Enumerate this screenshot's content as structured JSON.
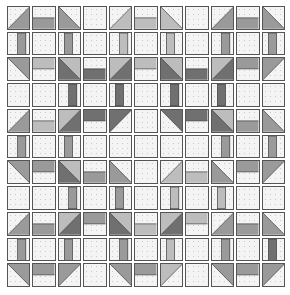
{
  "grid": {
    "rows": 11,
    "cols": 11
  },
  "fabrics": {
    "light": "#bdbdbd",
    "medium": "#9a9a9a",
    "dark": "#707070",
    "background": "#f4f4f4",
    "outline": "#555555"
  },
  "legend": {
    "E": "empty background square",
    "BR": "half-square triangle shaded bottom-right",
    "BL": "half-square triangle shaded bottom-left",
    "TR": "half-square triangle shaded top-right",
    "TL": "half-square triangle shaded top-left",
    "HB": "bar along bottom half",
    "HT": "bar along top half",
    "VL": "vertical bar left-center",
    "VR": "vertical bar right-center",
    "D1": "two-fabric HST light top-left / dark bottom-right",
    "D2": "two-fabric HST light top-right / dark bottom-left"
  },
  "cells": [
    [
      "BR:medium",
      "HB:medium",
      "BL:medium",
      "E",
      "BR:light",
      "HB:light",
      "BL:light",
      "E",
      "BR:medium",
      "HB:medium",
      "BL:medium"
    ],
    [
      "VR:medium",
      "E",
      "VL:medium",
      "E",
      "VR:light",
      "E",
      "VL:light",
      "E",
      "VR:medium",
      "E",
      "VL:medium"
    ],
    [
      "TR:medium",
      "HT:light",
      "D2",
      "HB:dark",
      "D1",
      "HT:light",
      "D2",
      "HB:dark",
      "D1",
      "HT:medium",
      "TL:medium"
    ],
    [
      "E",
      "E",
      "VR:dark",
      "E",
      "VL:dark",
      "E",
      "VR:dark",
      "E",
      "VL:dark",
      "E",
      "E"
    ],
    [
      "BR:medium",
      "HB:light",
      "D1",
      "HT:dark",
      "TL:dark",
      "E",
      "TR:dark",
      "HT:dark",
      "D2",
      "HB:medium",
      "BL:medium"
    ],
    [
      "VR:medium",
      "E",
      "VL:medium",
      "E",
      "E",
      "E",
      "E",
      "E",
      "VR:medium",
      "E",
      "VL:medium"
    ],
    [
      "TR:medium",
      "HT:medium",
      "D2",
      "HB:medium",
      "BL:medium",
      "E",
      "BR:light",
      "HB:light",
      "BL:medium",
      "HT:medium",
      "TL:medium"
    ],
    [
      "E",
      "E",
      "VR:medium",
      "E",
      "VL:medium",
      "E",
      "VR:light",
      "E",
      "VL:light",
      "E",
      "E"
    ],
    [
      "BR:medium",
      "HB:medium",
      "D1",
      "HT:medium",
      "D2",
      "HB:light",
      "D1",
      "HT:light",
      "BR:medium",
      "HB:medium",
      "BL:medium"
    ],
    [
      "VR:medium",
      "E",
      "VL:medium",
      "E",
      "VR:medium",
      "E",
      "VL:light",
      "E",
      "VR:medium",
      "E",
      "VL:dark"
    ],
    [
      "TR:medium",
      "HT:medium",
      "TL:medium",
      "E",
      "TR:medium",
      "HT:medium",
      "TL:light",
      "E",
      "TR:medium",
      "HT:medium",
      "TL:medium"
    ]
  ]
}
